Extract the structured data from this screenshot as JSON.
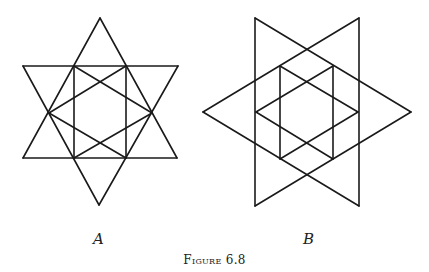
{
  "figure": {
    "caption": "Figure 6.8",
    "stroke_color": "#1a1a1a",
    "panels": [
      {
        "label": "A",
        "description": "Six-pointed star (two overlapping vertical-axis triangles) with inscribed rectangle and crossing diagonals",
        "lines": [
          [
            [
              100,
              18
            ],
            [
              23,
              158
            ]
          ],
          [
            [
              100,
              18
            ],
            [
              177,
              158
            ]
          ],
          [
            [
              23,
              158
            ],
            [
              177,
              158
            ]
          ],
          [
            [
              23,
              66
            ],
            [
              178,
              66
            ]
          ],
          [
            [
              23,
              66
            ],
            [
              99,
              205
            ]
          ],
          [
            [
              178,
              66
            ],
            [
              99,
              205
            ]
          ],
          [
            [
              74,
              66
            ],
            [
              74,
              158
            ]
          ],
          [
            [
              126,
              66
            ],
            [
              126,
              158
            ]
          ],
          [
            [
              74,
              66
            ],
            [
              152,
              113
            ]
          ],
          [
            [
              126,
              66
            ],
            [
              49,
              113
            ]
          ],
          [
            [
              49,
              113
            ],
            [
              126,
              158
            ]
          ],
          [
            [
              152,
              113
            ],
            [
              74,
              158
            ]
          ]
        ]
      },
      {
        "label": "B",
        "description": "Six-pointed star (two overlapping horizontal-axis triangles) with inscribed hexagram and vertical lines",
        "lines": [
          [
            [
              255,
              18
            ],
            [
              255,
              206
            ]
          ],
          [
            [
              255,
              18
            ],
            [
              411,
              112
            ]
          ],
          [
            [
              255,
              206
            ],
            [
              411,
              112
            ]
          ],
          [
            [
              359,
              18
            ],
            [
              359,
              206
            ]
          ],
          [
            [
              359,
              18
            ],
            [
              203,
              112
            ]
          ],
          [
            [
              359,
              206
            ],
            [
              203,
              112
            ]
          ],
          [
            [
              280,
              66
            ],
            [
              280,
              159
            ]
          ],
          [
            [
              333,
              66
            ],
            [
              333,
              159
            ]
          ],
          [
            [
              280,
              66
            ],
            [
              358,
              112
            ]
          ],
          [
            [
              333,
              66
            ],
            [
              256,
              112
            ]
          ],
          [
            [
              256,
              112
            ],
            [
              333,
              159
            ]
          ],
          [
            [
              358,
              112
            ],
            [
              280,
              159
            ]
          ]
        ]
      }
    ]
  }
}
